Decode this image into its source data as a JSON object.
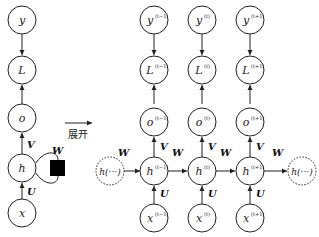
{
  "diagram": {
    "unfold_label": "展开",
    "folded": {
      "nodes": [
        {
          "id": "y",
          "label": "y"
        },
        {
          "id": "L",
          "label": "L"
        },
        {
          "id": "o",
          "label": "o"
        },
        {
          "id": "h",
          "label": "h"
        },
        {
          "id": "x",
          "label": "x"
        }
      ],
      "weights": {
        "U": "U",
        "V": "V",
        "W": "W"
      },
      "delay_block": "black-square"
    },
    "unfolded": {
      "timesteps": [
        {
          "y": "y",
          "y_sup": "(t−1)",
          "L": "L",
          "L_sup": "(t−1)",
          "o": "o",
          "o_sup": "(t−1)",
          "h": "h",
          "h_sup": "(t−1)",
          "x": "x",
          "x_sup": "(t−1)"
        },
        {
          "y": "y",
          "y_sup": "(t)",
          "L": "L",
          "L_sup": "(t)",
          "o": "o",
          "o_sup": "(t)",
          "h": "h",
          "h_sup": "(t)",
          "x": "x",
          "x_sup": "(t)"
        },
        {
          "y": "y",
          "y_sup": "(t+1)",
          "L": "L",
          "L_sup": "(t+1)",
          "o": "o",
          "o_sup": "(t+1)",
          "h": "h",
          "h_sup": "(t+1)",
          "x": "x",
          "x_sup": "(t+1)"
        }
      ],
      "start_node": "h(···)",
      "end_node": "h(···)",
      "weights": {
        "U": "U",
        "V": "V",
        "W": "W"
      }
    }
  }
}
